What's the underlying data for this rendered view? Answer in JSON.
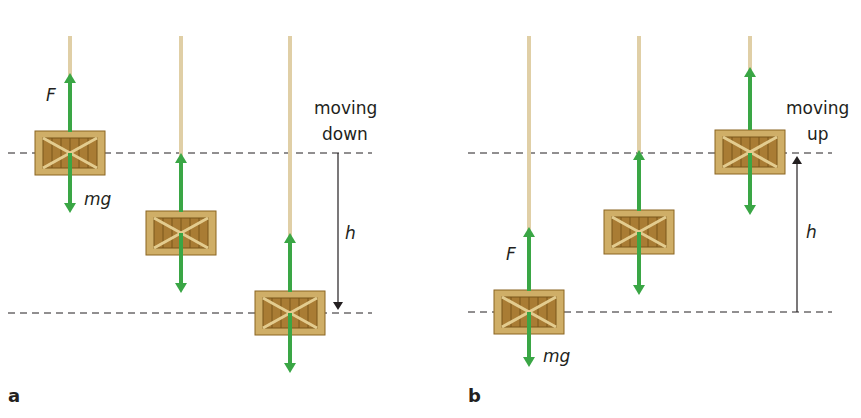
{
  "panels": [
    {
      "id": "a",
      "label": "a",
      "motion_text_line1": "moving",
      "motion_text_line2": "down",
      "height_label": "h",
      "force_label_up": "F",
      "force_label_down": "mg",
      "direction": "down"
    },
    {
      "id": "b",
      "label": "b",
      "motion_text_line1": "moving",
      "motion_text_line2": "up",
      "height_label": "h",
      "force_label_up": "F",
      "force_label_down": "mg",
      "direction": "up"
    }
  ],
  "colors": {
    "arrow": "#3aa645",
    "rope": "#e0cfa6",
    "crate_outer": "#c9a35a",
    "crate_inner": "#a8792e",
    "crate_border": "#8a6520",
    "dash": "#231f20"
  }
}
